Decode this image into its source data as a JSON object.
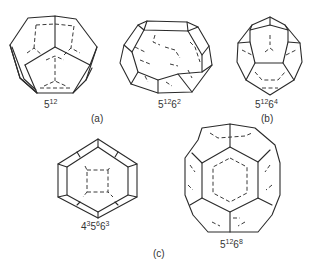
{
  "figure": {
    "panels": [
      {
        "id": "a",
        "label": "(a)"
      },
      {
        "id": "b",
        "label": "(b)"
      },
      {
        "id": "c",
        "label": "(c)"
      }
    ],
    "cages": [
      {
        "name": "dodecahedron",
        "formula": [
          {
            "base": "5",
            "exp": "12"
          }
        ],
        "panel": "a"
      },
      {
        "name": "tetrakaidecahedron",
        "formula": [
          {
            "base": "5",
            "exp": "12"
          },
          {
            "base": "6",
            "exp": "2"
          }
        ],
        "panel": "a"
      },
      {
        "name": "hexakaidecahedron",
        "formula": [
          {
            "base": "5",
            "exp": "12"
          },
          {
            "base": "6",
            "exp": "4"
          }
        ],
        "panel": "b"
      },
      {
        "name": "irregular-dodecahedron",
        "formula": [
          {
            "base": "4",
            "exp": "3"
          },
          {
            "base": "5",
            "exp": "6"
          },
          {
            "base": "6",
            "exp": "3"
          }
        ],
        "panel": "c"
      },
      {
        "name": "icosahedron",
        "formula": [
          {
            "base": "5",
            "exp": "12"
          },
          {
            "base": "6",
            "exp": "8"
          }
        ],
        "panel": "c"
      }
    ]
  }
}
